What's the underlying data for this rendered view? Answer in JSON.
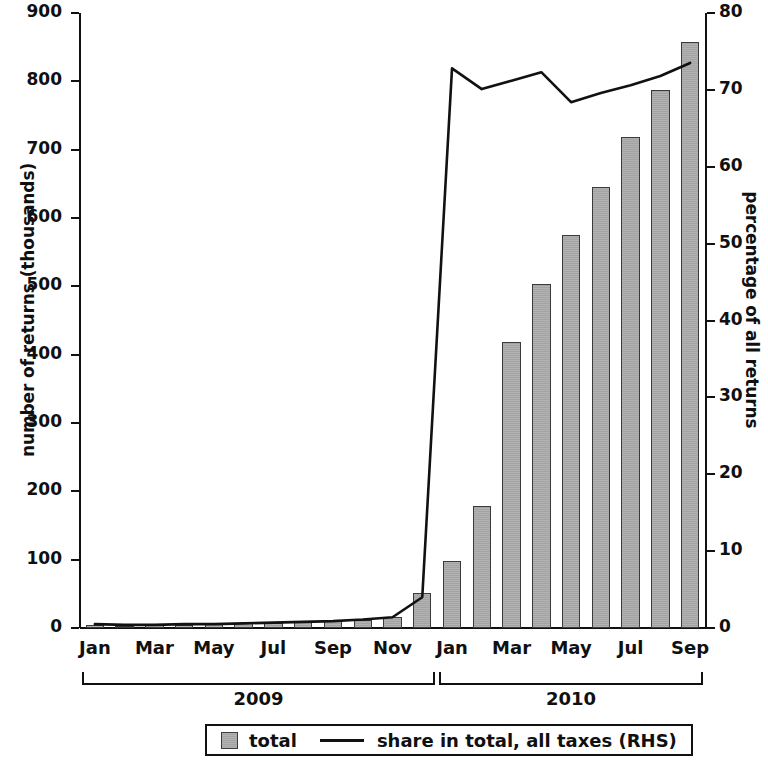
{
  "chart_data": {
    "type": "bar",
    "title": "",
    "xlabel": "",
    "ylabel": "number of returns  (thousands)",
    "y2label": "percentage of  all returns",
    "ylim": [
      0,
      900
    ],
    "y2lim": [
      0,
      80
    ],
    "yticks": [
      "0",
      "100",
      "200",
      "300",
      "400",
      "500",
      "600",
      "700",
      "800",
      "900"
    ],
    "y2ticks": [
      "0",
      "10",
      "20",
      "30",
      "40",
      "50",
      "60",
      "70",
      "80"
    ],
    "grid": false,
    "legend_position": "bottom",
    "categories": [
      "Jan 2009",
      "Feb 2009",
      "Mar 2009",
      "Apr 2009",
      "May 2009",
      "Jun 2009",
      "Jul 2009",
      "Aug 2009",
      "Sep 2009",
      "Oct 2009",
      "Nov 2009",
      "Dec 2009",
      "Jan 2010",
      "Feb 2010",
      "Mar 2010",
      "Apr 2010",
      "May 2010",
      "Jun 2010",
      "Jul 2010",
      "Aug 2010",
      "Sep 2010"
    ],
    "tick_labels": [
      "Jan",
      "",
      "Mar",
      "",
      "May",
      "",
      "Jul",
      "",
      "Sep",
      "",
      "Nov",
      "",
      "Jan",
      "",
      "Mar",
      "",
      "May",
      "",
      "Jul",
      "",
      "Sep"
    ],
    "group_brackets": [
      {
        "label": "2009",
        "start_index": 0,
        "end_index": 11
      },
      {
        "label": "2010",
        "start_index": 12,
        "end_index": 20
      }
    ],
    "series": [
      {
        "name": "total",
        "type": "bar",
        "axis": "left",
        "color": "#a9a9a9",
        "values": [
          4,
          3,
          4,
          5,
          6,
          7,
          8,
          9,
          10,
          12,
          16,
          51,
          98,
          178,
          419,
          504,
          575,
          646,
          718,
          788,
          857
        ]
      },
      {
        "name": "share in total, all taxes (RHS)",
        "type": "line",
        "axis": "right",
        "color": "#111111",
        "values": [
          0.5,
          0.4,
          0.4,
          0.5,
          0.5,
          0.6,
          0.7,
          0.8,
          0.9,
          1.1,
          1.4,
          4.0,
          72.8,
          70.1,
          71.2,
          72.3,
          68.4,
          69.6,
          70.6,
          71.8,
          73.5
        ]
      }
    ],
    "legend": [
      {
        "label": "total",
        "marker": "square"
      },
      {
        "label": "share in total, all taxes (RHS)",
        "marker": "line"
      }
    ]
  }
}
